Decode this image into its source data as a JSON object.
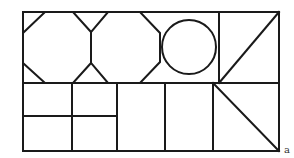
{
  "figure": {
    "label": "a",
    "colors": {
      "stroke": "#1a1a1a",
      "background": "#ffffff"
    },
    "top_row": [
      "octagon",
      "octagon",
      "circle",
      "square-with-diagonal"
    ],
    "bottom_row": [
      "2x2-grid",
      "rectangle",
      "rectangle",
      "square-with-diagonal"
    ]
  }
}
